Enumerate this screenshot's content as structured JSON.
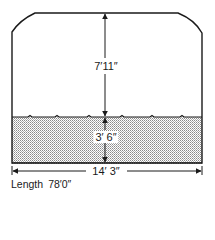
{
  "diagram": {
    "type": "tank cross-section",
    "colors": {
      "stroke": "#1a1a1a",
      "fill_pattern": "#8a8a8a",
      "background": "#ffffff"
    },
    "dimensions": {
      "air_space_height": "7′11″",
      "liquid_depth": "3′ 6″",
      "width": "14′ 3″"
    },
    "footer": {
      "length_label": "Length",
      "length_value": "78′0″"
    }
  }
}
